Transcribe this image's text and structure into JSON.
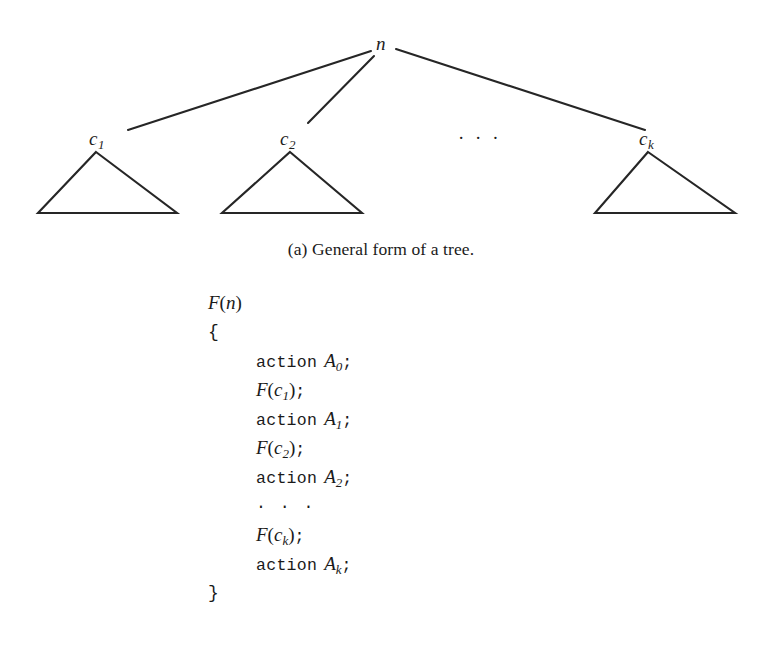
{
  "figure": {
    "caption": "(a) General form of a tree.",
    "tree": {
      "root": {
        "name": "n",
        "base": "n",
        "sub": ""
      },
      "children": [
        {
          "name": "c1",
          "base": "c",
          "sub": "1"
        },
        {
          "name": "c2",
          "base": "c",
          "sub": "2"
        },
        {
          "name": "ck",
          "base": "c",
          "sub": "k"
        }
      ],
      "ellipsis": "· · ·"
    }
  },
  "code": {
    "lines": [
      {
        "indent": false,
        "parts": [
          {
            "style": "mathit",
            "text": "F"
          },
          {
            "style": "mathrm",
            "text": "("
          },
          {
            "style": "mathit",
            "text": "n"
          },
          {
            "style": "mathrm",
            "text": ")"
          }
        ]
      },
      {
        "indent": false,
        "parts": [
          {
            "style": "brace",
            "text": "{"
          }
        ]
      },
      {
        "indent": true,
        "parts": [
          {
            "style": "kw",
            "text": "action"
          },
          {
            "style": "gap",
            "text": ""
          },
          {
            "style": "mathit",
            "text": "A"
          },
          {
            "style": "sub",
            "text": "0"
          },
          {
            "style": "semi",
            "text": ";"
          }
        ]
      },
      {
        "indent": true,
        "parts": [
          {
            "style": "mathit",
            "text": "F"
          },
          {
            "style": "mathrm",
            "text": "("
          },
          {
            "style": "mathit",
            "text": "c"
          },
          {
            "style": "sub",
            "text": "1"
          },
          {
            "style": "mathrm",
            "text": ")"
          },
          {
            "style": "semi",
            "text": ";"
          }
        ]
      },
      {
        "indent": true,
        "parts": [
          {
            "style": "kw",
            "text": "action"
          },
          {
            "style": "gap",
            "text": ""
          },
          {
            "style": "mathit",
            "text": "A"
          },
          {
            "style": "sub",
            "text": "1"
          },
          {
            "style": "semi",
            "text": ";"
          }
        ]
      },
      {
        "indent": true,
        "parts": [
          {
            "style": "mathit",
            "text": "F"
          },
          {
            "style": "mathrm",
            "text": "("
          },
          {
            "style": "mathit",
            "text": "c"
          },
          {
            "style": "sub",
            "text": "2"
          },
          {
            "style": "mathrm",
            "text": ")"
          },
          {
            "style": "semi",
            "text": ";"
          }
        ]
      },
      {
        "indent": true,
        "parts": [
          {
            "style": "kw",
            "text": "action"
          },
          {
            "style": "gap",
            "text": ""
          },
          {
            "style": "mathit",
            "text": "A"
          },
          {
            "style": "sub",
            "text": "2"
          },
          {
            "style": "semi",
            "text": ";"
          }
        ]
      },
      {
        "indent": true,
        "parts": [
          {
            "style": "dots",
            "text": "· · ·"
          }
        ]
      },
      {
        "indent": true,
        "parts": [
          {
            "style": "mathit",
            "text": "F"
          },
          {
            "style": "mathrm",
            "text": "("
          },
          {
            "style": "mathit",
            "text": "c"
          },
          {
            "style": "sub",
            "text": "k"
          },
          {
            "style": "mathrm",
            "text": ")"
          },
          {
            "style": "semi",
            "text": ";"
          }
        ]
      },
      {
        "indent": true,
        "parts": [
          {
            "style": "kw",
            "text": "action"
          },
          {
            "style": "gap",
            "text": ""
          },
          {
            "style": "mathit",
            "text": "A"
          },
          {
            "style": "sub",
            "text": "k"
          },
          {
            "style": "semi",
            "text": ";"
          }
        ]
      },
      {
        "indent": false,
        "parts": [
          {
            "style": "brace",
            "text": "}"
          }
        ]
      }
    ]
  },
  "style": {
    "ink": "#1d1d1d",
    "background": "#ffffff"
  }
}
